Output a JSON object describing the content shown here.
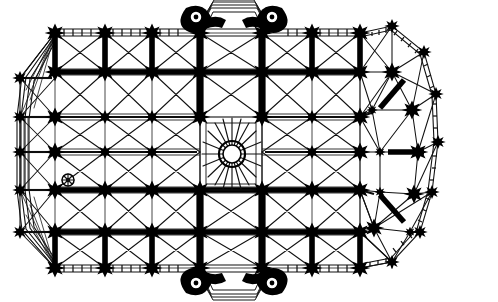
{
  "document": {
    "title": "Gothic cathedral vaulting plan",
    "kind": "architectural-floor-plan",
    "caption": "",
    "background_color": "#ffffff",
    "ink_color": "#000000",
    "width_px": 498,
    "height_px": 302
  },
  "plan": {
    "orientation": "west at left, east (apse) at right",
    "nave_grid": {
      "column_x": [
        55,
        105,
        152,
        200,
        262,
        312,
        360
      ],
      "row_y": [
        33,
        72,
        117,
        152,
        190,
        232,
        268
      ],
      "bay_count_longitudinal": 6,
      "bay_count_transverse": 6
    },
    "west_end": {
      "type": "polygonal narthex",
      "outer_pier_x": 20,
      "outer_pier_y": [
        78,
        117,
        190,
        232
      ],
      "corner_nodes": [
        [
          20,
          78
        ],
        [
          20,
          117
        ],
        [
          20,
          190
        ],
        [
          20,
          232
        ]
      ]
    },
    "east_end": {
      "type": "polygonal chevet with ambulatory and radiating chapels",
      "ambulatory_nodes": [
        [
          390,
          28
        ],
        [
          420,
          52
        ],
        [
          432,
          92
        ],
        [
          436,
          140
        ],
        [
          432,
          190
        ],
        [
          420,
          232
        ],
        [
          390,
          262
        ],
        [
          392,
          282
        ]
      ],
      "inner_apse_nodes": [
        [
          382,
          78
        ],
        [
          408,
          112
        ],
        [
          412,
          152
        ],
        [
          400,
          196
        ],
        [
          378,
          228
        ]
      ],
      "hemicycle_center": [
        390,
        150
      ]
    },
    "central_feature": {
      "name": "crossing oculus rosette",
      "center_x": 232,
      "center_y": 154,
      "outer_radius": 13,
      "inner_radius": 9,
      "spoke_count": 24,
      "bay_left": 200,
      "bay_right": 262,
      "bay_top": 117,
      "bay_bottom": 190
    },
    "turrets": [
      {
        "name": "north-west stair turret",
        "x": 196,
        "y": 17,
        "radius": 8
      },
      {
        "name": "north-east stair turret",
        "x": 272,
        "y": 17,
        "radius": 8
      },
      {
        "name": "south-west stair turret",
        "x": 196,
        "y": 280,
        "radius": 8
      },
      {
        "name": "south-east stair turret",
        "x": 272,
        "y": 280,
        "radius": 8
      },
      {
        "name": "west side small turret",
        "x": 68,
        "y": 180,
        "radius": 6
      }
    ],
    "portals": [
      {
        "name": "north transept porch",
        "x": 234,
        "y": 6,
        "width": 64
      },
      {
        "name": "south transept porch",
        "x": 234,
        "y": 296,
        "width": 64
      }
    ],
    "walls": {
      "north_wall_y": 33,
      "south_wall_y": 268,
      "hatched": true,
      "hatch_description": "ladder-pattern double line with perpendicular rungs"
    },
    "legend": {
      "thick_ribs": "transverse and longitudinal arches / wall ribs",
      "thin_ribs": "diagonal quadripartite vault ribs",
      "black_stars": "compound piers"
    }
  }
}
